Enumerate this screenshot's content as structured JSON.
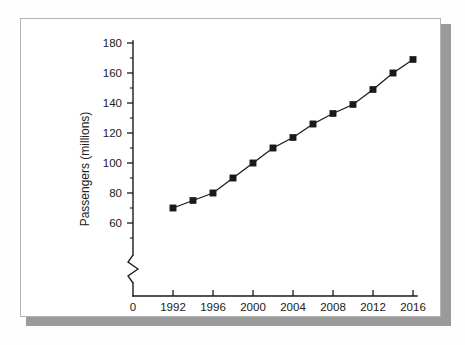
{
  "figure": {
    "frame_color": "#b4b4b4",
    "shadow_color": "#9a9a9a",
    "background": "#ffffff"
  },
  "chart_data": {
    "type": "line",
    "title": "",
    "xlabel": "Year",
    "ylabel": "Passengers (millions)",
    "x": [
      1992,
      1994,
      1996,
      1998,
      2000,
      2002,
      2004,
      2006,
      2008,
      2010,
      2012,
      2014,
      2016
    ],
    "values": [
      70,
      75,
      80,
      90,
      100,
      110,
      117,
      126,
      133,
      139,
      149,
      160,
      169
    ],
    "series": [
      {
        "name": "Passengers",
        "values": [
          70,
          75,
          80,
          90,
          100,
          110,
          117,
          126,
          133,
          139,
          149,
          160,
          169
        ]
      }
    ],
    "xlim": [
      1991,
      2017
    ],
    "ylim": [
      50,
      180
    ],
    "xticks": [
      1992,
      1996,
      2000,
      2004,
      2008,
      2012,
      2016
    ],
    "xtick_labels": [
      "1992",
      "1996",
      "2000",
      "2004",
      "2008",
      "2012",
      "2016"
    ],
    "yticks": [
      60,
      80,
      100,
      120,
      140,
      160,
      180
    ],
    "ytick_labels": [
      "60",
      "80",
      "100",
      "120",
      "140",
      "160",
      "180"
    ],
    "y_minor_ticks": [
      50,
      70,
      90,
      110,
      130,
      150,
      170
    ],
    "origin_label": "0",
    "axis_break": "y-axis",
    "grid": false,
    "legend": false,
    "marker": "square",
    "line_color": "#1a1a1a",
    "marker_color": "#1a1a1a"
  }
}
